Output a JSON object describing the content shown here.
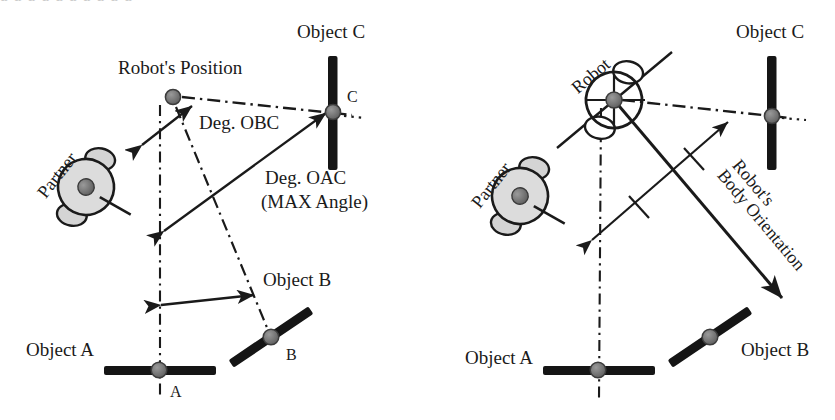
{
  "figure": {
    "panels": [
      {
        "id": "left",
        "name": "angle-definitions-panel",
        "labels": {
          "partner": "Partner",
          "robot_position": "Robot's Position",
          "object_a": "Object A",
          "object_b": "Object B",
          "object_c": "Object C",
          "point_a": "A",
          "point_b": "B",
          "point_c": "C",
          "deg_obc": "Deg. OBC",
          "deg_oac": "Deg. OAC",
          "max_angle": "(MAX Angle)"
        }
      },
      {
        "id": "right",
        "name": "body-orientation-panel",
        "labels": {
          "partner": "Partner",
          "robot": "Robot",
          "object_a": "Object A",
          "object_b": "Object B",
          "object_c": "Object C",
          "body_orientation_line1": "Robot's",
          "body_orientation_line2": "Body Orientation"
        }
      }
    ],
    "colors": {
      "ink": "#1a1a1a",
      "object_bar": "#151515",
      "marker_dot": "#6e6e6e",
      "partner_body": "#d9d9d9",
      "robot_body": "#ffffff"
    },
    "top_ghost_text": "a a  a       a a a a    a    a a"
  }
}
